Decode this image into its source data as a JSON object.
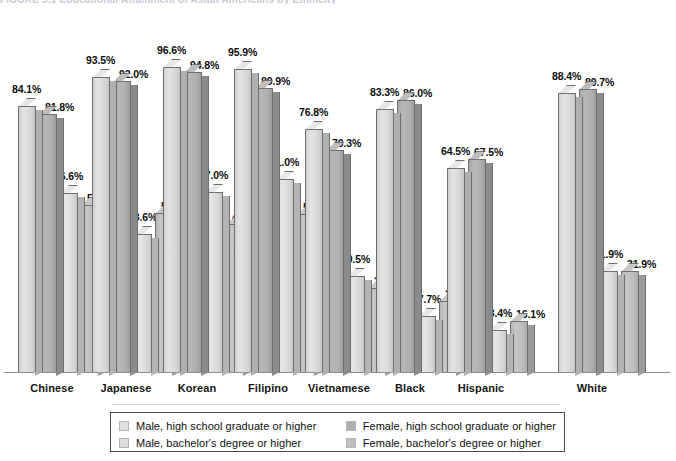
{
  "title_cutoff": "FIGURE 5.1 Educational Attainment of Asian Americans by Ethnicity",
  "chart_data": {
    "type": "bar",
    "title": "",
    "xlabel": "",
    "ylabel": "",
    "ylim": [
      0,
      100
    ],
    "grid": false,
    "legend_position": "bottom",
    "value_suffix": "%",
    "categories": [
      "Chinese",
      "Japanese",
      "Korean",
      "Filipino",
      "Vietnamese",
      "Black",
      "Hispanic",
      "White"
    ],
    "series": [
      {
        "name": "Male, high school graduate or higher",
        "color": "#e0e0e0",
        "values": [
          84.1,
          93.5,
          96.6,
          95.9,
          76.8,
          83.3,
          64.5,
          88.4
        ],
        "labels": [
          "84.1%",
          "93.5%",
          "96.6%",
          "95.9%",
          "76.8%",
          "83.3%",
          "64.5%",
          "88.4%"
        ]
      },
      {
        "name": "Female, high school graduate or higher",
        "color": "#b0b0b0",
        "values": [
          81.8,
          92.0,
          94.8,
          89.9,
          70.3,
          86.0,
          67.5,
          89.7
        ],
        "labels": [
          "81.8%",
          "92.0%",
          "94.8%",
          "89.9%",
          "70.3%",
          "86.0%",
          "67.5%",
          "89.7%"
        ]
      },
      {
        "name": "Male, bachelor's degree or higher",
        "color": "#dcdcdc",
        "values": [
          56.6,
          43.6,
          57.0,
          61.0,
          30.5,
          17.7,
          13.4,
          31.9
        ],
        "labels": [
          "56.6%",
          "43.6%",
          "57.0%",
          "61.0%",
          "30.5%",
          "17.7%",
          "13.4%",
          "31.9%"
        ]
      },
      {
        "name": "Female, bachelor's degree or higher",
        "color": "#c0c0c0",
        "values": [
          53.0,
          50.3,
          46.7,
          50.1,
          26.7,
          22.4,
          16.1,
          31.9
        ],
        "labels": [
          "53.0%",
          "50.3%",
          "46.7%",
          "50.1%",
          "26.7%",
          "22.4%",
          "16.1%",
          "31.9%"
        ]
      }
    ]
  },
  "legend": {
    "items": [
      {
        "label": "Male, high school graduate or higher",
        "color": "#e0e0e0"
      },
      {
        "label": "Female, high school graduate or higher",
        "color": "#b0b0b0"
      },
      {
        "label": "Male, bachelor's degree or higher",
        "color": "#dcdcdc"
      },
      {
        "label": "Female, bachelor's degree or higher",
        "color": "#c0c0c0"
      }
    ]
  }
}
